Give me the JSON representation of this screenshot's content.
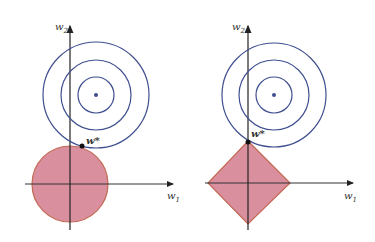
{
  "colors": {
    "contour": "#3f4f8f",
    "fill": "#d98a9a",
    "edge": "#c0604a",
    "axis": "#222222"
  },
  "panels": [
    {
      "name": "L2 regularization",
      "constraint_shape": "circle",
      "axis_x_label": "w",
      "axis_x_sub": "1",
      "axis_y_label": "w",
      "axis_y_sub": "2",
      "optimum_label": "w*"
    },
    {
      "name": "L1 regularization",
      "constraint_shape": "diamond",
      "axis_x_label": "w",
      "axis_x_sub": "1",
      "axis_y_label": "w",
      "axis_y_sub": "2",
      "optimum_label": "w*"
    }
  ]
}
